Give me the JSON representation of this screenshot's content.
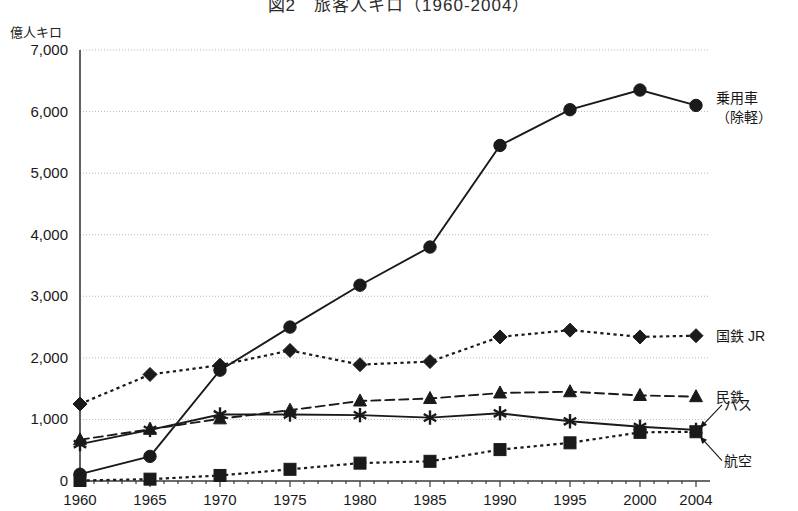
{
  "chart_data": {
    "type": "line",
    "title": "図2　旅客人キロ（1960-2004）",
    "ylabel": "億人キロ",
    "xlabel": "",
    "ylim": [
      0,
      7000
    ],
    "ytick_labels": [
      "0",
      "1,000",
      "2,000",
      "3,000",
      "4,000",
      "5,000",
      "6,000",
      "7,000"
    ],
    "ytick_values": [
      0,
      1000,
      2000,
      3000,
      4000,
      5000,
      6000,
      7000
    ],
    "grid": true,
    "legend_position": "right-inline-labels",
    "x": [
      1960,
      1965,
      1970,
      1975,
      1980,
      1985,
      1990,
      1995,
      2000,
      2004
    ],
    "xtick_labels": [
      "1960",
      "1965",
      "1970",
      "1975",
      "1980",
      "1985",
      "1990",
      "1995",
      "2000",
      "2004"
    ],
    "series": [
      {
        "name": "乗用車（除軽）",
        "label": "乗用車",
        "label_line2": "（除軽）",
        "marker": "circle",
        "linestyle": "solid",
        "color": "#1a1a1a",
        "values": [
          110,
          400,
          1800,
          2500,
          3180,
          3800,
          5450,
          6030,
          6350,
          6100
        ]
      },
      {
        "name": "国鉄 JR",
        "label": "国鉄 JR",
        "marker": "diamond",
        "linestyle": "dotted",
        "color": "#1a1a1a",
        "values": [
          1250,
          1730,
          1880,
          2120,
          1890,
          1940,
          2340,
          2450,
          2340,
          2360
        ]
      },
      {
        "name": "民鉄",
        "label": "民鉄",
        "marker": "triangle",
        "linestyle": "dashed",
        "color": "#1a1a1a",
        "values": [
          670,
          840,
          1010,
          1150,
          1300,
          1340,
          1430,
          1450,
          1390,
          1370
        ]
      },
      {
        "name": "バス",
        "label": "バス",
        "marker": "asterisk",
        "linestyle": "solid",
        "color": "#1a1a1a",
        "values": [
          600,
          830,
          1080,
          1080,
          1070,
          1030,
          1100,
          970,
          880,
          830
        ]
      },
      {
        "name": "航空",
        "label": "航空",
        "marker": "square",
        "linestyle": "dotted",
        "color": "#1a1a1a",
        "values": [
          8,
          30,
          90,
          190,
          290,
          320,
          510,
          620,
          790,
          800
        ]
      }
    ]
  }
}
